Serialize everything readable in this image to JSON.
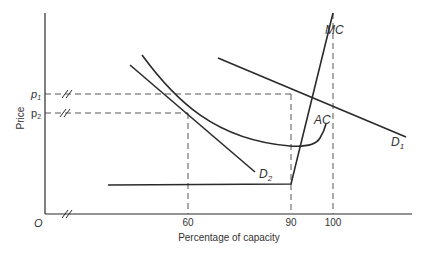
{
  "diagram": {
    "type": "economics-cost-demand-diagram",
    "axes": {
      "ylabel": "Price",
      "xlabel": "Percentage of capacity",
      "origin_label": "O",
      "y_ticks": [
        {
          "label_main": "p",
          "label_sub": "1",
          "y": 94
        },
        {
          "label_main": "p",
          "label_sub": "2",
          "y": 113
        }
      ],
      "x_ticks": [
        {
          "label": "60",
          "x": 188
        },
        {
          "label": "90",
          "x": 291
        },
        {
          "label": "100",
          "x": 333
        }
      ]
    },
    "curves": {
      "mc": {
        "label": "MC"
      },
      "ac": {
        "label": "AC"
      },
      "d1": {
        "label_main": "D",
        "label_sub": "1"
      },
      "d2": {
        "label_main": "D",
        "label_sub": "2"
      }
    },
    "colors": {
      "line": "#2a2a2a",
      "text": "#333333",
      "background": "#ffffff"
    }
  }
}
